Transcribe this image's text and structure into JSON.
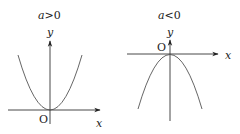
{
  "diagram": {
    "panels": [
      {
        "condition": "a>0",
        "condition_var": "a",
        "condition_op": ">0",
        "x_label": "x",
        "y_label": "y",
        "origin_label": "O",
        "curve": "upward-opening parabola, vertex at origin"
      },
      {
        "condition": "a<0",
        "condition_var": "a",
        "condition_op": "<0",
        "x_label": "x",
        "y_label": "y",
        "origin_label": "O",
        "curve": "downward-opening parabola, vertex at origin"
      }
    ]
  },
  "colors": {
    "line": "#333333",
    "curve": "#555555",
    "text": "#222222"
  }
}
